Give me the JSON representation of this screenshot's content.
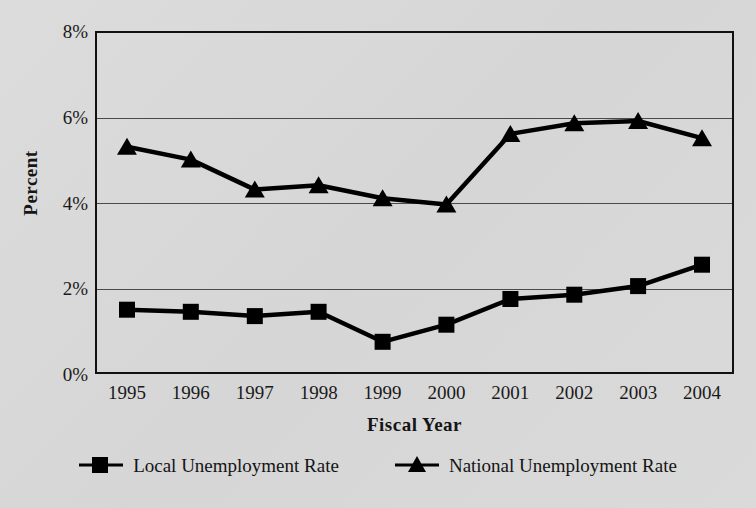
{
  "chart_data": {
    "type": "line",
    "title": "",
    "xlabel": "Fiscal Year",
    "ylabel": "Percent",
    "categories": [
      "1995",
      "1996",
      "1997",
      "1998",
      "1999",
      "2000",
      "2001",
      "2002",
      "2003",
      "2004"
    ],
    "ylim": [
      0,
      8
    ],
    "yticks": [
      0,
      2,
      4,
      6,
      8
    ],
    "ytick_labels": [
      "0%",
      "2%",
      "4%",
      "6%",
      "8%"
    ],
    "grid": "horizontal",
    "legend_position": "bottom",
    "series": [
      {
        "name": "Local Unemployment Rate",
        "marker": "square",
        "color": "#000000",
        "values": [
          1.5,
          1.45,
          1.35,
          1.45,
          0.75,
          1.15,
          1.75,
          1.85,
          2.05,
          2.55
        ]
      },
      {
        "name": "National Unemployment Rate",
        "marker": "triangle",
        "color": "#000000",
        "values": [
          5.3,
          5.0,
          4.3,
          4.4,
          4.1,
          3.95,
          5.6,
          5.85,
          5.9,
          5.5
        ]
      }
    ]
  },
  "axes": {
    "y_title": "Percent",
    "x_title": "Fiscal Year"
  },
  "legend": {
    "entries": [
      {
        "label": "Local Unemployment Rate",
        "marker": "square-marker-icon"
      },
      {
        "label": "National Unemployment Rate",
        "marker": "triangle-marker-icon"
      }
    ]
  },
  "colors": {
    "background": "#d9d9d9",
    "ink": "#111111",
    "gridline": "#4a4a4a"
  }
}
